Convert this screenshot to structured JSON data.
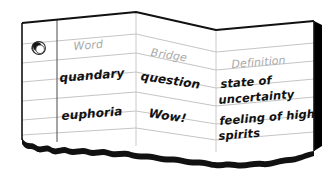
{
  "document": {
    "type": "folded-ruled-notebook-page",
    "title": "Vocabulary bridge chart",
    "panels": 3,
    "hole_punch": true,
    "ruled_lines_per_panel": 6,
    "torn_bottom_edge": true,
    "colors": {
      "paper": "#ffffff",
      "rule_line": "#b9b9b9",
      "outline": "#1a1a1a",
      "header_text": "#a9a9a9",
      "body_text": "#111111",
      "shadow": "#000000"
    }
  },
  "headers": {
    "word": "Word",
    "bridge": "Bridge",
    "definition": "Definition"
  },
  "rows": [
    {
      "word": "quandary",
      "bridge": "question",
      "definition_line1": "state of",
      "definition_line2": "uncertainty"
    },
    {
      "word": "euphoria",
      "bridge": "Wow!",
      "definition_line1": "feeling of high",
      "definition_line2": "spirits"
    }
  ],
  "icons": {
    "hole_punch": "hole-punch-icon"
  }
}
